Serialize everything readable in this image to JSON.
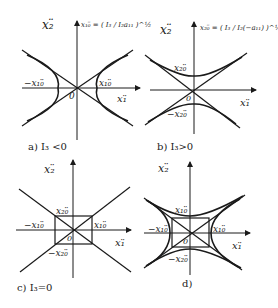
{
  "panels": [
    {
      "id": "a",
      "caption": "a)  I₃ <0",
      "y_axis_label": "x₂̈",
      "x_axis_label": "x₁̈",
      "origin_label": "0",
      "formula": "x₁₀̈ = ( I₃ / I₂a₁₁ )^½",
      "vertex_labels": {
        "right": "x₁₀̈",
        "left": "−x₁₀̈"
      },
      "curve_type": "hyperbola-horizontal"
    },
    {
      "id": "b",
      "caption": "b)  I₃>0",
      "y_axis_label": "x₂̈",
      "x_axis_label": "x₁̈",
      "origin_label": "0",
      "formula": "x₂₀̈ = ( I₃ / I₂(−a₁₁) )^½",
      "vertex_labels": {
        "top": "x₂₀̈",
        "bottom": "−x₂₀̈"
      },
      "curve_type": "hyperbola-vertical"
    },
    {
      "id": "c",
      "caption": "c)  I₃=0",
      "y_axis_label": "x₂̈",
      "x_axis_label": "x₁̈",
      "origin_label": "0",
      "vertex_labels": {
        "top": "x₂₀̈",
        "bottom": "−x₂₀̈",
        "right": "x₁₀̈",
        "left": "−x₁₀̈"
      },
      "curve_type": "asymptotes-with-rectangle"
    },
    {
      "id": "d",
      "caption": "d)",
      "y_axis_label": "x₂̈",
      "x_axis_label": "x₁̈",
      "origin_label": "0",
      "vertex_labels": {
        "top": "x₁₀̈",
        "bottom": "−x₂₀̈",
        "right": "x₁₀̈",
        "left": "−x₁₀̈"
      },
      "curve_type": "hyperbola-family-with-rectangle"
    }
  ]
}
